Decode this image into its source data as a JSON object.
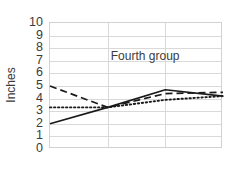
{
  "chart_data": {
    "type": "line",
    "title": "",
    "subtitle": "",
    "xlabel": "",
    "ylabel": "Inches",
    "ylim": [
      0,
      10
    ],
    "xlim": [
      0,
      3
    ],
    "yticks": [
      10,
      9,
      8,
      7,
      6,
      5,
      4,
      3,
      2,
      1,
      0
    ],
    "xticks": [],
    "xticklabels": [],
    "grid": "both",
    "legend": "none",
    "annotations": [
      {
        "text": "Fourth group",
        "x": 1.65,
        "y": 7.35
      }
    ],
    "x": [
      0,
      1,
      2,
      3
    ],
    "series": [
      {
        "name": "solid",
        "style": "solid",
        "color": "#1a1a1a",
        "values": [
          2.0,
          3.3,
          4.7,
          4.2
        ]
      },
      {
        "name": "dashed",
        "style": "dashed",
        "color": "#1a1a1a",
        "values": [
          5.0,
          3.3,
          4.4,
          4.5
        ]
      },
      {
        "name": "dotted",
        "style": "dotted",
        "color": "#1a1a1a",
        "values": [
          3.3,
          3.3,
          3.9,
          4.2
        ]
      }
    ]
  },
  "style": {
    "grid_color": "#d9d9d9",
    "axis_color": "#d2d2d2",
    "text_color": "#3b3b3b",
    "background": "#ffffff"
  }
}
